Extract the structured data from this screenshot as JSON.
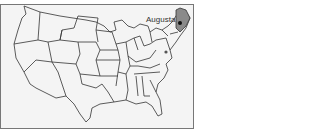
{
  "map": {
    "title": "United States",
    "highlighted_state": "Maine",
    "capital_label": "Augusta",
    "colors": {
      "background": "#f4f4f4",
      "border": "#333333",
      "highlight": "#8a8a8a",
      "marker": "#111111"
    }
  }
}
